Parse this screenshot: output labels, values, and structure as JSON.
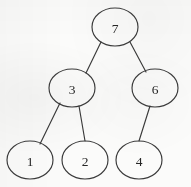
{
  "figure": {
    "kind": "binary-tree-diagram",
    "width": 191,
    "height": 187,
    "background_color": "#fbfbfa",
    "stroke_color": "#3a3a3a",
    "label_color": "#262626"
  },
  "tree": {
    "root_id": "n7",
    "nodes": [
      {
        "id": "n7",
        "label": "7",
        "cx": 115,
        "cy": 27,
        "rx": 23,
        "ry": 19,
        "depth": 0
      },
      {
        "id": "n3",
        "label": "3",
        "cx": 72,
        "cy": 88,
        "rx": 23,
        "ry": 19,
        "depth": 1
      },
      {
        "id": "n6",
        "label": "6",
        "cx": 155,
        "cy": 88,
        "rx": 23,
        "ry": 19,
        "depth": 1
      },
      {
        "id": "n1",
        "label": "1",
        "cx": 30,
        "cy": 160,
        "rx": 23,
        "ry": 19,
        "depth": 2
      },
      {
        "id": "n2",
        "label": "2",
        "cx": 85,
        "cy": 160,
        "rx": 23,
        "ry": 19,
        "depth": 2
      },
      {
        "id": "n4",
        "label": "4",
        "cx": 139,
        "cy": 160,
        "rx": 23,
        "ry": 19,
        "depth": 2
      }
    ],
    "edges": [
      {
        "id": "e-7-3",
        "from": "n7",
        "to": "n3",
        "side": "left",
        "x1": 101,
        "y1": 42,
        "x2": 86,
        "y2": 73
      },
      {
        "id": "e-7-6",
        "from": "n7",
        "to": "n6",
        "side": "right",
        "x1": 130,
        "y1": 42,
        "x2": 146,
        "y2": 72
      },
      {
        "id": "e-3-1",
        "from": "n3",
        "to": "n1",
        "side": "left",
        "x1": 60,
        "y1": 103,
        "x2": 40,
        "y2": 144
      },
      {
        "id": "e-3-2",
        "from": "n3",
        "to": "n2",
        "side": "right",
        "x1": 79,
        "y1": 106,
        "x2": 85,
        "y2": 141
      },
      {
        "id": "e-6-4",
        "from": "n6",
        "to": "n4",
        "side": "left",
        "x1": 150,
        "y1": 106,
        "x2": 139,
        "y2": 141
      }
    ]
  }
}
